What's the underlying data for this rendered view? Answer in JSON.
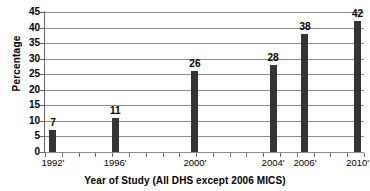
{
  "chart_data": {
    "type": "bar",
    "title": "",
    "xlabel": "Year of Study (All DHS except 2006 MICS)",
    "ylabel": "Percentage",
    "categories": [
      "1992'",
      "1996'",
      "2000'",
      "2004'",
      "2006'",
      "2010'"
    ],
    "values": [
      7,
      11,
      26,
      28,
      38,
      42
    ],
    "value_labels": [
      "7",
      "11",
      "26",
      "28",
      "38",
      "42"
    ],
    "ylim": [
      0,
      45
    ],
    "ytick_labels": [
      "0",
      "5",
      "10",
      "15",
      "20",
      "25",
      "30",
      "35",
      "40",
      "45"
    ],
    "ytick_values": [
      0,
      5,
      10,
      15,
      20,
      25,
      30,
      35,
      40,
      45
    ],
    "grid": true,
    "legend": "none",
    "bar_color": "#343434",
    "grid_color": "#8c8c8c",
    "axis_color": "#4d4d4d",
    "x_positions_pct": [
      2.5,
      22.0,
      47.0,
      71.5,
      81.5,
      98.0
    ]
  }
}
